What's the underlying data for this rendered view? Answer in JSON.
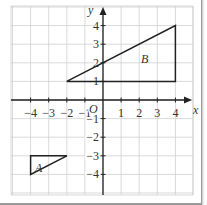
{
  "diagram": {
    "type": "coordinate-grid",
    "axes": {
      "x_label": "x",
      "y_label": "y",
      "origin_label": "O",
      "x_range": [
        -5,
        5
      ],
      "y_range": [
        -5,
        5
      ],
      "x_ticks": [
        "−4",
        "−3",
        "−2",
        "−1",
        "1",
        "2",
        "3",
        "4"
      ],
      "y_ticks": [
        "4",
        "3",
        "2",
        "1",
        "−1",
        "−2",
        "−3",
        "−4"
      ]
    },
    "shapes": [
      {
        "label": "A",
        "vertices": [
          [
            -4,
            -3
          ],
          [
            -2,
            -3
          ],
          [
            -4,
            -4
          ]
        ]
      },
      {
        "label": "B",
        "vertices": [
          [
            -2,
            1
          ],
          [
            4,
            1
          ],
          [
            4,
            4
          ]
        ]
      }
    ],
    "colors": {
      "grid": "#cfcfcf",
      "axis": "#222222",
      "shape_stroke": "#222222"
    }
  }
}
